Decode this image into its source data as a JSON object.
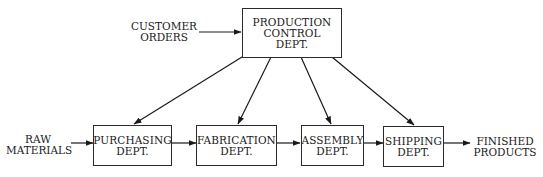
{
  "diagram": {
    "type": "flowchart",
    "nodes": {
      "production_control": {
        "lines": [
          "PRODUCTION",
          "CONTROL",
          "DEPT."
        ]
      },
      "purchasing": {
        "lines": [
          "PURCHASING",
          "DEPT."
        ]
      },
      "fabrication": {
        "lines": [
          "FABRICATION",
          "DEPT."
        ]
      },
      "assembly": {
        "lines": [
          "ASSEMBLY",
          "DEPT."
        ]
      },
      "shipping": {
        "lines": [
          "SHIPPING",
          "DEPT."
        ]
      }
    },
    "external": {
      "customer_orders": {
        "lines": [
          "CUSTOMER",
          "ORDERS"
        ]
      },
      "raw_materials": {
        "lines": [
          "RAW",
          "MATERIALS"
        ]
      },
      "finished_products": {
        "lines": [
          "FINISHED",
          "PRODUCTS"
        ]
      }
    },
    "edges": [
      {
        "from": "CUSTOMER ORDERS",
        "to": "PRODUCTION CONTROL DEPT."
      },
      {
        "from": "PRODUCTION CONTROL DEPT.",
        "to": "PURCHASING DEPT."
      },
      {
        "from": "PRODUCTION CONTROL DEPT.",
        "to": "FABRICATION DEPT."
      },
      {
        "from": "PRODUCTION CONTROL DEPT.",
        "to": "ASSEMBLY DEPT."
      },
      {
        "from": "PRODUCTION CONTROL DEPT.",
        "to": "SHIPPING DEPT."
      },
      {
        "from": "RAW MATERIALS",
        "to": "PURCHASING DEPT."
      },
      {
        "from": "PURCHASING DEPT.",
        "to": "FABRICATION DEPT."
      },
      {
        "from": "FABRICATION DEPT.",
        "to": "ASSEMBLY DEPT."
      },
      {
        "from": "ASSEMBLY DEPT.",
        "to": "SHIPPING DEPT."
      },
      {
        "from": "SHIPPING DEPT.",
        "to": "FINISHED PRODUCTS"
      }
    ]
  }
}
